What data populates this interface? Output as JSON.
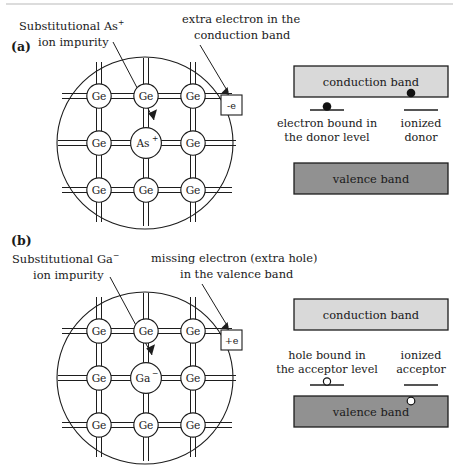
{
  "figure": {
    "top_rule": true
  },
  "colors": {
    "conduction_band_fill": "#d9d9d9",
    "valence_band_fill": "#919191",
    "outline": "#1d1d1d",
    "text": "#1a1a1a",
    "page_background": "#ffffff",
    "top_rule": "#b9b9b9"
  },
  "panels": [
    {
      "id": "a",
      "label": "(a)",
      "annotations": [
        {
          "name": "impurity-annotation",
          "lines": [
            "Substitutional As",
            "ion impurity"
          ],
          "superscript": "+",
          "superscript_on_line": 0
        },
        {
          "name": "carrier-annotation",
          "lines": [
            "extra electron in the",
            "conduction band"
          ],
          "superscript": "",
          "superscript_on_line": -1
        }
      ],
      "lattice": {
        "host_atom": "Ge",
        "impurity_atom": "As",
        "impurity_charge": "+",
        "rows": 3,
        "cols": 3,
        "impurity_position": {
          "row": 1,
          "col": 1
        }
      },
      "charge_box": {
        "label": "-e",
        "name": "free-electron-box"
      },
      "bands": {
        "conduction": {
          "label": "conduction band",
          "fill": "#d9d9d9"
        },
        "valence": {
          "label": "valence band",
          "fill": "#919191"
        }
      },
      "levels": [
        {
          "name": "bound-donor-level",
          "lines": [
            "electron bound in",
            "the donor level"
          ],
          "label_position": "below",
          "carrier": "electron",
          "carrier_filled": true,
          "carrier_on_level": true
        },
        {
          "name": "ionized-donor-level",
          "lines": [
            "ionized",
            "donor"
          ],
          "label_position": "below",
          "carrier": "none",
          "carrier_filled": false,
          "carrier_on_level": false
        }
      ],
      "band_carrier": {
        "name": "conduction-band-electron",
        "type": "electron",
        "filled": true,
        "in_band": "conduction"
      }
    },
    {
      "id": "b",
      "label": "(b)",
      "annotations": [
        {
          "name": "impurity-annotation",
          "lines": [
            "Substitutional Ga",
            "ion impurity"
          ],
          "superscript": "−",
          "superscript_on_line": 0
        },
        {
          "name": "carrier-annotation",
          "lines": [
            "missing electron (extra hole)",
            "in the valence band"
          ],
          "superscript": "",
          "superscript_on_line": -1
        }
      ],
      "lattice": {
        "host_atom": "Ge",
        "impurity_atom": "Ga",
        "impurity_charge": "−",
        "rows": 3,
        "cols": 3,
        "impurity_position": {
          "row": 1,
          "col": 1
        }
      },
      "charge_box": {
        "label": "+e",
        "name": "free-hole-box"
      },
      "bands": {
        "conduction": {
          "label": "conduction band",
          "fill": "#d9d9d9"
        },
        "valence": {
          "label": "valence band",
          "fill": "#919191"
        }
      },
      "levels": [
        {
          "name": "bound-acceptor-level",
          "lines": [
            "hole bound in",
            "the acceptor level"
          ],
          "label_position": "above",
          "carrier": "hole",
          "carrier_filled": false,
          "carrier_on_level": true
        },
        {
          "name": "ionized-acceptor-level",
          "lines": [
            "ionized",
            "acceptor"
          ],
          "label_position": "above",
          "carrier": "none",
          "carrier_filled": false,
          "carrier_on_level": false
        }
      ],
      "band_carrier": {
        "name": "valence-band-hole",
        "type": "hole",
        "filled": false,
        "in_band": "valence"
      }
    }
  ]
}
